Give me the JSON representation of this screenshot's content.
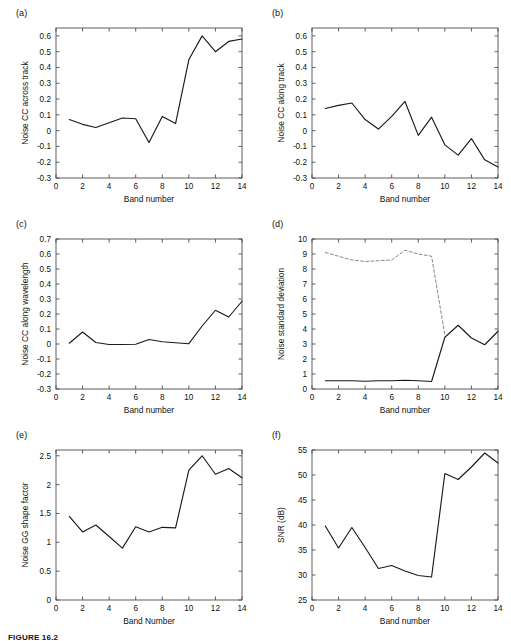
{
  "figure": {
    "caption": "FIGURE 16.2",
    "background": "#ffffff",
    "line_color": "#1a1a1a",
    "dash_color": "#7a7a7a",
    "axis_color": "#4d4d4d"
  },
  "panels": [
    {
      "tag": "(a)",
      "name": "panel-a-noise-cc-across-track"
    },
    {
      "tag": "(b)",
      "name": "panel-b-noise-cc-along-track"
    },
    {
      "tag": "(c)",
      "name": "panel-c-noise-cc-along-wavelength"
    },
    {
      "tag": "(d)",
      "name": "panel-d-noise-standard-deviation"
    },
    {
      "tag": "(e)",
      "name": "panel-e-noise-gg-shape-factor"
    },
    {
      "tag": "(f)",
      "name": "panel-f-snr"
    }
  ],
  "chart_data": [
    {
      "type": "line",
      "panel": "(a)",
      "title": "",
      "xlabel": "Band number",
      "ylabel": "Noise CC across track",
      "xlim": [
        0,
        14
      ],
      "ylim": [
        -0.3,
        0.65
      ],
      "xticks": [
        0,
        2,
        4,
        6,
        8,
        10,
        12,
        14
      ],
      "xticklabels": [
        "0",
        "2",
        "4",
        "6",
        "8",
        "10",
        "12",
        "14"
      ],
      "yticks": [
        -0.3,
        -0.2,
        -0.1,
        0,
        0.1,
        0.2,
        0.3,
        0.4,
        0.5,
        0.6
      ],
      "yticklabels": [
        "-0.3",
        "-0.2",
        "-0.1",
        "0",
        "0.1",
        "0.2",
        "0.3",
        "0.4",
        "0.5",
        "0.6"
      ],
      "grid": false,
      "legend": null,
      "x": [
        1,
        2,
        3,
        4,
        5,
        6,
        7,
        8,
        9,
        10,
        11,
        12,
        13,
        14
      ],
      "values": [
        0.07,
        0.04,
        0.02,
        0.05,
        0.08,
        0.075,
        -0.075,
        0.09,
        0.045,
        0.45,
        0.6,
        0.5,
        0.565,
        0.58
      ]
    },
    {
      "type": "line",
      "panel": "(b)",
      "title": "",
      "xlabel": "Band number",
      "ylabel": "Noise CC along track",
      "xlim": [
        0,
        14
      ],
      "ylim": [
        -0.3,
        0.65
      ],
      "xticks": [
        0,
        2,
        4,
        6,
        8,
        10,
        12,
        14
      ],
      "xticklabels": [
        "0",
        "2",
        "4",
        "6",
        "8",
        "10",
        "12",
        "14"
      ],
      "yticks": [
        -0.3,
        -0.2,
        -0.1,
        0,
        0.1,
        0.2,
        0.3,
        0.4,
        0.5,
        0.6
      ],
      "yticklabels": [
        "-0.3",
        "-0.2",
        "-0.1",
        "0",
        "0.1",
        "0.2",
        "0.3",
        "0.4",
        "0.5",
        "0.6"
      ],
      "grid": false,
      "legend": null,
      "x": [
        1,
        2,
        3,
        4,
        5,
        6,
        7,
        8,
        9,
        10,
        11,
        12,
        13,
        14
      ],
      "values": [
        0.14,
        0.16,
        0.175,
        0.07,
        0.01,
        0.09,
        0.185,
        -0.03,
        0.085,
        -0.09,
        -0.155,
        -0.05,
        -0.185,
        -0.23
      ]
    },
    {
      "type": "line",
      "panel": "(c)",
      "title": "",
      "xlabel": "Band number",
      "ylabel": "Noise CC along wavelength",
      "xlim": [
        0,
        14
      ],
      "ylim": [
        -0.3,
        0.7
      ],
      "xticks": [
        0,
        2,
        4,
        6,
        8,
        10,
        12,
        14
      ],
      "xticklabels": [
        "0",
        "2",
        "4",
        "6",
        "8",
        "10",
        "12",
        "14"
      ],
      "yticks": [
        -0.3,
        -0.2,
        -0.1,
        0,
        0.1,
        0.2,
        0.3,
        0.4,
        0.5,
        0.6,
        0.7
      ],
      "yticklabels": [
        "-0.3",
        "-0.2",
        "-0.1",
        "0",
        "0.1",
        "0.2",
        "0.3",
        "0.4",
        "0.5",
        "0.6",
        "0.7"
      ],
      "grid": false,
      "legend": null,
      "x": [
        1,
        2,
        3,
        4,
        5,
        6,
        7,
        8,
        9,
        10,
        11,
        12,
        13,
        14
      ],
      "values": [
        0.005,
        0.08,
        0.01,
        -0.003,
        -0.003,
        -0.002,
        0.03,
        0.015,
        0.008,
        0.002,
        0.12,
        0.225,
        0.18,
        0.285
      ]
    },
    {
      "type": "line",
      "panel": "(d)",
      "title": "",
      "xlabel": "Band number",
      "ylabel": "Noise standard deviation",
      "xlim": [
        0,
        14
      ],
      "ylim": [
        0,
        10
      ],
      "xticks": [
        0,
        2,
        4,
        6,
        8,
        10,
        12,
        14
      ],
      "xticklabels": [
        "0",
        "2",
        "4",
        "6",
        "8",
        "10",
        "12",
        "14"
      ],
      "yticks": [
        0,
        1,
        2,
        3,
        4,
        5,
        6,
        7,
        8,
        9,
        10
      ],
      "yticklabels": [
        "0",
        "1",
        "2",
        "3",
        "4",
        "5",
        "6",
        "7",
        "8",
        "9",
        "10"
      ],
      "grid": false,
      "legend": null,
      "x": [
        1,
        2,
        3,
        4,
        5,
        6,
        7,
        8,
        9,
        10,
        11,
        12,
        13,
        14
      ],
      "series": [
        {
          "name": "dashed-upper",
          "style": "dashed",
          "values": [
            9.1,
            8.85,
            8.6,
            8.5,
            8.55,
            8.6,
            9.25,
            9.0,
            8.85,
            3.6,
            null,
            null,
            null,
            null
          ]
        },
        {
          "name": "solid-lower",
          "style": "solid",
          "values": [
            0.55,
            0.55,
            0.55,
            0.52,
            0.55,
            0.55,
            0.58,
            0.55,
            0.5,
            3.45,
            4.25,
            3.4,
            2.95,
            3.85
          ]
        }
      ]
    },
    {
      "type": "line",
      "panel": "(e)",
      "title": "",
      "xlabel": "Band Number",
      "ylabel": "Noise GG shape factor",
      "xlim": [
        0,
        14
      ],
      "ylim": [
        0,
        2.6
      ],
      "xticks": [
        0,
        2,
        4,
        6,
        8,
        10,
        12,
        14
      ],
      "xticklabels": [
        "0",
        "2",
        "4",
        "6",
        "8",
        "10",
        "12",
        "14"
      ],
      "yticks": [
        0,
        0.5,
        1,
        1.5,
        2,
        2.5
      ],
      "yticklabels": [
        "0",
        "0.5",
        "1",
        "1.5",
        "2",
        "2.5"
      ],
      "grid": false,
      "legend": null,
      "x": [
        1,
        2,
        3,
        4,
        5,
        6,
        7,
        8,
        9,
        10,
        11,
        12,
        13,
        14
      ],
      "values": [
        1.45,
        1.18,
        1.3,
        1.1,
        0.9,
        1.27,
        1.18,
        1.26,
        1.25,
        2.25,
        2.5,
        2.18,
        2.28,
        2.12
      ]
    },
    {
      "type": "line",
      "panel": "(f)",
      "title": "",
      "xlabel": "Band number",
      "ylabel": "SNR (dB)",
      "xlim": [
        0,
        14
      ],
      "ylim": [
        25,
        55
      ],
      "xticks": [
        0,
        2,
        4,
        6,
        8,
        10,
        12,
        14
      ],
      "xticklabels": [
        "0",
        "2",
        "4",
        "6",
        "8",
        "10",
        "12",
        "14"
      ],
      "yticks": [
        25,
        30,
        35,
        40,
        45,
        50,
        55
      ],
      "yticklabels": [
        "25",
        "30",
        "35",
        "40",
        "45",
        "50",
        "55"
      ],
      "grid": false,
      "legend": null,
      "x": [
        1,
        2,
        3,
        4,
        5,
        6,
        7,
        8,
        9,
        10,
        11,
        12,
        13,
        14
      ],
      "values": [
        39.8,
        35.4,
        39.5,
        35.5,
        31.3,
        31.9,
        30.8,
        29.9,
        29.6,
        50.3,
        49.1,
        51.6,
        54.4,
        52.4
      ]
    }
  ]
}
